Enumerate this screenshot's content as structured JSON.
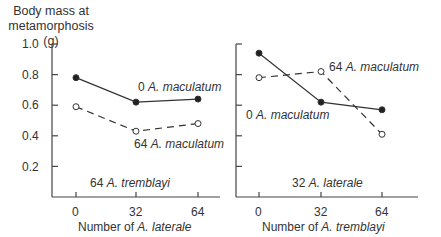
{
  "chart_data": [
    {
      "type": "line",
      "panel": "left",
      "title": "",
      "ylabel": "Body mass at metamorphosis (g)",
      "xlabel": "Number of A. laterale",
      "x": [
        0,
        32,
        64
      ],
      "ylim": [
        0,
        1.0
      ],
      "yticks": [
        "0.2",
        "0.4",
        "0.6",
        "0.8",
        "1.0"
      ],
      "xticks": [
        "0",
        "32",
        "64"
      ],
      "grid": false,
      "condition_label": "64 A. tremblayi",
      "series": [
        {
          "name": "0 A. maculatum",
          "marker": "filled",
          "line": "solid",
          "values": [
            0.78,
            0.62,
            0.64
          ]
        },
        {
          "name": "64 A. maculatum",
          "marker": "open",
          "line": "dashed",
          "values": [
            0.59,
            0.43,
            0.48
          ]
        }
      ]
    },
    {
      "type": "line",
      "panel": "right",
      "title": "",
      "ylabel": "Body mass at metamorphosis (g)",
      "xlabel": "Number of A. tremblayi",
      "x": [
        0,
        32,
        64
      ],
      "ylim": [
        0,
        1.0
      ],
      "yticks": [
        "0.2",
        "0.4",
        "0.6",
        "0.8",
        "1.0"
      ],
      "xticks": [
        "0",
        "32",
        "64"
      ],
      "grid": false,
      "condition_label": "32 A. laterale",
      "series": [
        {
          "name": "0 A. maculatum",
          "marker": "filled",
          "line": "solid",
          "values": [
            0.94,
            0.62,
            0.57
          ]
        },
        {
          "name": "64 A. maculatum",
          "marker": "open",
          "line": "dashed",
          "values": [
            0.78,
            0.82,
            0.41
          ]
        }
      ]
    }
  ],
  "labels": {
    "ytitle_line1": "Body mass at",
    "ytitle_line2": "metamorphosis (g)",
    "yticks": [
      "1.0",
      "0.8",
      "0.6",
      "0.4",
      "0.2"
    ],
    "xticks": [
      "0",
      "32",
      "64"
    ],
    "left": {
      "xlabel_prefix": "Number of ",
      "xlabel_species": "A. laterale",
      "condition_count": "64 ",
      "condition_species": "A. tremblayi",
      "series0_count": "0 ",
      "series0_species": "A. maculatum",
      "series1_count": "64 ",
      "series1_species": "A. maculatum"
    },
    "right": {
      "xlabel_prefix": "Number of ",
      "xlabel_species": "A. tremblayi",
      "condition_count": "32 ",
      "condition_species": "A. laterale",
      "series0_count": "0 ",
      "series0_species": "A. maculatum",
      "series1_count": "64 ",
      "series1_species": "A. maculatum"
    }
  }
}
